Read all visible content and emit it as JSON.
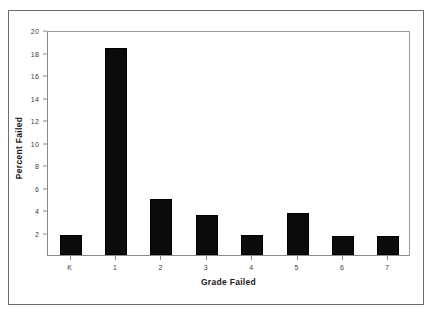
{
  "chart_data": {
    "type": "bar",
    "title": "",
    "subtitle": "",
    "xlabel": "Grade Failed",
    "ylabel": "Percent Failed",
    "categories": [
      "K",
      "1",
      "2",
      "3",
      "4",
      "5",
      "6",
      "7"
    ],
    "values": [
      1.8,
      18.4,
      5.0,
      3.6,
      1.8,
      3.7,
      1.7,
      1.7
    ],
    "series": [
      {
        "name": "Percent Failed",
        "values": [
          1.8,
          18.4,
          5.0,
          3.6,
          1.8,
          3.7,
          1.7,
          1.7
        ]
      }
    ],
    "ylim": [
      0,
      20
    ],
    "y_ticks": [
      2,
      4,
      6,
      8,
      10,
      12,
      14,
      16,
      18,
      20
    ],
    "y_tick_labels": [
      "2",
      "4",
      "6",
      "8",
      "10",
      "12",
      "14",
      "16",
      "18",
      "20"
    ],
    "x_tick_labels": [
      "K",
      "1",
      "2",
      "3",
      "4",
      "5",
      "6",
      "7"
    ],
    "grid": false,
    "legend": null,
    "legend_position": "none",
    "bar_color": "#0b0b0b",
    "axis_color": "#8a8a8a",
    "frame_color": "#6d6d6d",
    "background": "#ffffff",
    "annotations": []
  }
}
